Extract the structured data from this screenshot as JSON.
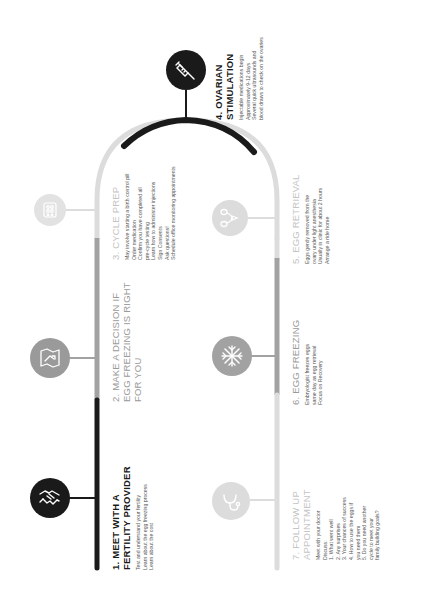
{
  "colors": {
    "done": "#1a1a1a",
    "mid": "#9a9a9a",
    "light": "#d4d4d4",
    "text_light": "#c4c4c4"
  },
  "steps": [
    {
      "number": 1,
      "title_line1": "1. MEET WITH A",
      "title_line2": "FERTILITY PROVIDER",
      "items": [
        "Test and understand your fertility",
        "Learn about the egg freezing process",
        "Learn about the cost"
      ],
      "icon": "handshake-icon",
      "state": "dark"
    },
    {
      "number": 2,
      "title_line1": "2. MAKE A DECISION IF",
      "title_line2": "EGG FREEZING IS RIGHT",
      "title_line3": "FOR YOU",
      "items": [],
      "icon": "decision-map-icon",
      "state": "gray"
    },
    {
      "number": 3,
      "title_line1": "3. CYCLE PREP",
      "items": [
        "May involve starting a birth control pill",
        "Order medication",
        "Confirm you have completed all",
        "pre-cycle testing",
        "Learn how to administer injections",
        "Sign Consents",
        "Ask questions!",
        "Schedule office monitoring appointments"
      ],
      "icon": "calendar-pills-icon",
      "state": "light"
    },
    {
      "number": 4,
      "title_line1": "4. OVARIAN",
      "title_line2": "STIMULATION",
      "items": [
        "Injectable medications begin",
        "Approximately 9-12 days",
        "Several quick ultrasounds and",
        "blood draws to check on the ovaries"
      ],
      "icon": "syringe-icon",
      "state": "dark"
    },
    {
      "number": 5,
      "title_line1": "5. EGG  RETRIEVAL",
      "items": [
        "Eggs gently removed from the",
        "ovary under light anesthesia",
        "Usually in clinic for about 2 hours",
        "Arrange a ride home"
      ],
      "icon": "ovaries-icon",
      "state": "light"
    },
    {
      "number": 6,
      "title_line1": "6. EGG FREEZING",
      "items": [
        "Embryologist freezes eggs",
        "same day as egg retrieval",
        "Focus on Recovery"
      ],
      "icon": "snowflake-icon",
      "state": "gray"
    },
    {
      "number": 7,
      "title_line1": "7. FOLLOW UP",
      "title_line2": "APPOINTMENT",
      "items": [
        "Meet with your doctor",
        "Discuss:",
        "1. What went well",
        "2. Any surprises",
        "3. Your chances of success",
        "4. How to use the eggs if",
        "    you need them",
        "5. Do you need another",
        "    cycle to meet your",
        "    family building goals?"
      ],
      "icon": "stethoscope-icon",
      "state": "light"
    }
  ]
}
